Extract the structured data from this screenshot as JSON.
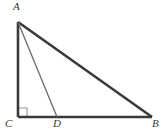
{
  "figure": {
    "background_color": "#ffffff",
    "stroke_color": "#3a3a3a",
    "cevian_color": "#6a6a6a",
    "right_angle_color": "#9a9a9a",
    "label_color": "#3a3a3a",
    "canvas": {
      "width": 165,
      "height": 136
    },
    "points": [
      {
        "name": "A",
        "label": "A",
        "x": 18,
        "y": 22
      },
      {
        "name": "B",
        "label": "B",
        "x": 152,
        "y": 117
      },
      {
        "name": "C",
        "label": "C",
        "x": 18,
        "y": 117
      },
      {
        "name": "D",
        "label": "D",
        "x": 57,
        "y": 117
      }
    ],
    "segments": [
      {
        "name": "AC",
        "from": "A",
        "to": "C",
        "width": 2.6,
        "style": "solid"
      },
      {
        "name": "CB",
        "from": "C",
        "to": "B",
        "width": 2.6,
        "style": "solid"
      },
      {
        "name": "AB",
        "from": "A",
        "to": "B",
        "width": 2.6,
        "style": "solid"
      },
      {
        "name": "AD",
        "from": "A",
        "to": "D",
        "width": 1.3,
        "style": "solid"
      }
    ],
    "right_angle": {
      "at_vertex": "C",
      "size": 9,
      "marker": "square"
    },
    "labels": {
      "A": "A",
      "B": "B",
      "C": "C",
      "D": "D"
    }
  }
}
